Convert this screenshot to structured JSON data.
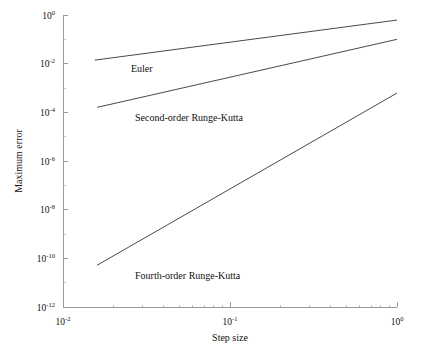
{
  "chart_data": {
    "type": "line",
    "title": "",
    "xlabel": "Step size",
    "ylabel": "Maximum error",
    "xscale": "log",
    "yscale": "log",
    "xlim": [
      0.01,
      1.0
    ],
    "ylim": [
      1e-12,
      1.0
    ],
    "grid": false,
    "legend": "inline-annotations",
    "xticks": [
      {
        "value": 0.01,
        "label": "10",
        "exponent": "-2"
      },
      {
        "value": 0.1,
        "label": "10",
        "exponent": "-1"
      },
      {
        "value": 1.0,
        "label": "10",
        "exponent": "0"
      }
    ],
    "yticks": [
      {
        "value": 1.0,
        "label": "10",
        "exponent": "0"
      },
      {
        "value": 0.01,
        "label": "10",
        "exponent": "-2"
      },
      {
        "value": 0.0001,
        "label": "10",
        "exponent": "-4"
      },
      {
        "value": 1e-06,
        "label": "10",
        "exponent": "-6"
      },
      {
        "value": 1e-08,
        "label": "10",
        "exponent": "-8"
      },
      {
        "value": 1e-10,
        "label": "10",
        "exponent": "-10"
      },
      {
        "value": 1e-12,
        "label": "10",
        "exponent": "-12"
      }
    ],
    "series": [
      {
        "name": "Euler",
        "label": "Euler",
        "order": 1,
        "color": "#4a4a4a",
        "x": [
          0.0155,
          1.0
        ],
        "y": [
          0.014,
          0.62
        ],
        "label_x": 0.0255,
        "label_y": 0.0047
      },
      {
        "name": "Second-order Runge-Kutta",
        "label": "Second-order Runge-Kutta",
        "order": 2,
        "color": "#4a4a4a",
        "x": [
          0.016,
          1.0
        ],
        "y": [
          0.00016,
          0.1
        ],
        "label_x": 0.027,
        "label_y": 4.6e-05
      },
      {
        "name": "Fourth-order Runge-Kutta",
        "label": "Fourth-order Runge-Kutta",
        "order": 4,
        "color": "#4a4a4a",
        "x": [
          0.016,
          1.0
        ],
        "y": [
          5.2e-11,
          0.00062
        ],
        "label_x": 0.027,
        "label_y": 1.45e-11
      }
    ]
  }
}
